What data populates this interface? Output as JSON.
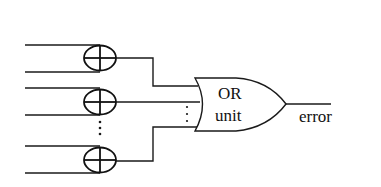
{
  "diagram": {
    "type": "logic-circuit",
    "xor_units": [
      {
        "id": "xor-1",
        "symbol": "⊕"
      },
      {
        "id": "xor-2",
        "symbol": "⊕"
      },
      {
        "id": "xor-n",
        "symbol": "⊕"
      }
    ],
    "ellipsis": "⋮",
    "or_gate": {
      "line1": "OR",
      "line2": "unit"
    },
    "output_label": "error",
    "colors": {
      "stroke": "#1a1a1a",
      "background": "#ffffff"
    }
  }
}
